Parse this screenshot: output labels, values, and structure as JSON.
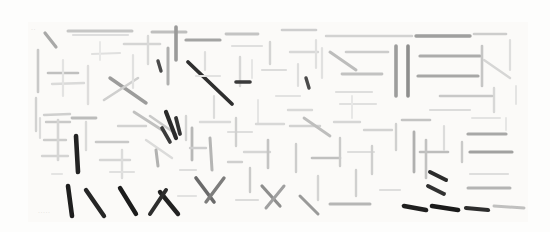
{
  "image": {
    "title": "Abstract stroke composition",
    "background_color": "#fdfdfc",
    "content_bounds": {
      "x": 30,
      "y": 24,
      "width": 495,
      "height": 196
    },
    "description": "Dense field of short straight line strokes in varying grays and blacks, arranged in loose grid-like clusters resembling deconstructed calligraphic characters"
  },
  "palette": {
    "paper": "#fdfdfc",
    "wash": "#fbfaf8",
    "lightest_stroke": "#ededec",
    "light_stroke": "#dcdcdb",
    "mid_stroke": "#b9b9b8",
    "dark_stroke": "#8a8a89",
    "darkest_stroke": "#2b2b2b"
  },
  "faint_marks": [
    {
      "text": "·····",
      "x": 38,
      "y": 210
    },
    {
      "text": "··",
      "x": 31,
      "y": 27
    }
  ],
  "strokes": [
    {
      "x1": 45,
      "y1": 33,
      "x2": 56,
      "y2": 47,
      "w": 3.2,
      "c": "#a9a9a8"
    },
    {
      "x1": 68,
      "y1": 31,
      "x2": 132,
      "y2": 31,
      "w": 3.0,
      "c": "#c6c6c5"
    },
    {
      "x1": 73,
      "y1": 35,
      "x2": 128,
      "y2": 35,
      "w": 2.2,
      "c": "#dedede"
    },
    {
      "x1": 38,
      "y1": 50,
      "x2": 38,
      "y2": 92,
      "w": 2.6,
      "c": "#c9c9c8"
    },
    {
      "x1": 36,
      "y1": 98,
      "x2": 36,
      "y2": 131,
      "w": 2.4,
      "c": "#d2d2d1"
    },
    {
      "x1": 48,
      "y1": 73,
      "x2": 78,
      "y2": 73,
      "w": 2.6,
      "c": "#c0c0bf"
    },
    {
      "x1": 52,
      "y1": 84,
      "x2": 84,
      "y2": 83,
      "w": 2.4,
      "c": "#dadad9"
    },
    {
      "x1": 44,
      "y1": 115,
      "x2": 70,
      "y2": 114,
      "w": 2.4,
      "c": "#cfcfce"
    },
    {
      "x1": 63,
      "y1": 60,
      "x2": 63,
      "y2": 96,
      "w": 2.2,
      "c": "#e3e3e2"
    },
    {
      "x1": 92,
      "y1": 54,
      "x2": 120,
      "y2": 53,
      "w": 2.2,
      "c": "#e0e0df"
    },
    {
      "x1": 88,
      "y1": 66,
      "x2": 88,
      "y2": 104,
      "w": 2.4,
      "c": "#dedddc"
    },
    {
      "x1": 100,
      "y1": 42,
      "x2": 100,
      "y2": 60,
      "w": 2.0,
      "c": "#e8e8e7"
    },
    {
      "x1": 110,
      "y1": 78,
      "x2": 146,
      "y2": 103,
      "w": 3.4,
      "c": "#9c9c9b"
    },
    {
      "x1": 104,
      "y1": 100,
      "x2": 138,
      "y2": 78,
      "w": 2.6,
      "c": "#cfcfce"
    },
    {
      "x1": 124,
      "y1": 44,
      "x2": 160,
      "y2": 44,
      "w": 2.6,
      "c": "#d5d5d4"
    },
    {
      "x1": 133,
      "y1": 55,
      "x2": 133,
      "y2": 88,
      "w": 2.2,
      "c": "#e1e1e0"
    },
    {
      "x1": 148,
      "y1": 36,
      "x2": 148,
      "y2": 64,
      "w": 2.4,
      "c": "#d9d9d8"
    },
    {
      "x1": 152,
      "y1": 32,
      "x2": 186,
      "y2": 32,
      "w": 3.0,
      "c": "#bfbfbe"
    },
    {
      "x1": 158,
      "y1": 61,
      "x2": 161,
      "y2": 71,
      "w": 3.4,
      "c": "#4a4a4a"
    },
    {
      "x1": 168,
      "y1": 48,
      "x2": 168,
      "y2": 84,
      "w": 3.0,
      "c": "#b0b0af"
    },
    {
      "x1": 176,
      "y1": 27,
      "x2": 176,
      "y2": 60,
      "w": 3.6,
      "c": "#9a9a99"
    },
    {
      "x1": 186,
      "y1": 40,
      "x2": 220,
      "y2": 40,
      "w": 3.2,
      "c": "#a4a4a3"
    },
    {
      "x1": 188,
      "y1": 62,
      "x2": 232,
      "y2": 104,
      "w": 3.8,
      "c": "#2f2f2f"
    },
    {
      "x1": 196,
      "y1": 76,
      "x2": 220,
      "y2": 76,
      "w": 2.2,
      "c": "#e2e2e1"
    },
    {
      "x1": 205,
      "y1": 52,
      "x2": 205,
      "y2": 70,
      "w": 2.2,
      "c": "#dededd"
    },
    {
      "x1": 214,
      "y1": 96,
      "x2": 214,
      "y2": 118,
      "w": 2.2,
      "c": "#dcdcdb"
    },
    {
      "x1": 226,
      "y1": 34,
      "x2": 258,
      "y2": 34,
      "w": 2.8,
      "c": "#c4c4c3"
    },
    {
      "x1": 232,
      "y1": 46,
      "x2": 262,
      "y2": 46,
      "w": 2.2,
      "c": "#dfdfde"
    },
    {
      "x1": 240,
      "y1": 57,
      "x2": 240,
      "y2": 86,
      "w": 2.4,
      "c": "#d7d7d6"
    },
    {
      "x1": 236,
      "y1": 82,
      "x2": 250,
      "y2": 82,
      "w": 3.6,
      "c": "#3a3a3a"
    },
    {
      "x1": 252,
      "y1": 60,
      "x2": 252,
      "y2": 78,
      "w": 2.0,
      "c": "#e6e6e5"
    },
    {
      "x1": 262,
      "y1": 70,
      "x2": 286,
      "y2": 70,
      "w": 2.2,
      "c": "#dcdcdb"
    },
    {
      "x1": 270,
      "y1": 42,
      "x2": 270,
      "y2": 64,
      "w": 2.4,
      "c": "#d4d4d3"
    },
    {
      "x1": 258,
      "y1": 100,
      "x2": 258,
      "y2": 124,
      "w": 2.0,
      "c": "#e5e5e4"
    },
    {
      "x1": 282,
      "y1": 30,
      "x2": 316,
      "y2": 30,
      "w": 2.6,
      "c": "#cecece"
    },
    {
      "x1": 290,
      "y1": 52,
      "x2": 318,
      "y2": 52,
      "w": 2.4,
      "c": "#d8d8d7"
    },
    {
      "x1": 298,
      "y1": 64,
      "x2": 298,
      "y2": 86,
      "w": 2.2,
      "c": "#dededd"
    },
    {
      "x1": 306,
      "y1": 78,
      "x2": 309,
      "y2": 88,
      "w": 3.4,
      "c": "#4b4b4b"
    },
    {
      "x1": 316,
      "y1": 40,
      "x2": 316,
      "y2": 68,
      "w": 2.2,
      "c": "#e0e0df"
    },
    {
      "x1": 276,
      "y1": 96,
      "x2": 300,
      "y2": 96,
      "w": 2.2,
      "c": "#e2e2e1"
    },
    {
      "x1": 288,
      "y1": 110,
      "x2": 312,
      "y2": 110,
      "w": 2.4,
      "c": "#d9d9d8"
    },
    {
      "x1": 326,
      "y1": 36,
      "x2": 412,
      "y2": 36,
      "w": 2.4,
      "c": "#d2d2d1"
    },
    {
      "x1": 330,
      "y1": 52,
      "x2": 356,
      "y2": 70,
      "w": 3.0,
      "c": "#bdbdbc"
    },
    {
      "x1": 346,
      "y1": 52,
      "x2": 388,
      "y2": 52,
      "w": 2.6,
      "c": "#cccccb"
    },
    {
      "x1": 342,
      "y1": 74,
      "x2": 382,
      "y2": 74,
      "w": 2.8,
      "c": "#c2c2c1"
    },
    {
      "x1": 336,
      "y1": 92,
      "x2": 372,
      "y2": 92,
      "w": 2.2,
      "c": "#dededd"
    },
    {
      "x1": 322,
      "y1": 48,
      "x2": 322,
      "y2": 78,
      "w": 2.2,
      "c": "#e1e1e0"
    },
    {
      "x1": 396,
      "y1": 46,
      "x2": 396,
      "y2": 96,
      "w": 3.6,
      "c": "#9d9d9c"
    },
    {
      "x1": 408,
      "y1": 46,
      "x2": 408,
      "y2": 96,
      "w": 3.6,
      "c": "#8e8e8d"
    },
    {
      "x1": 416,
      "y1": 36,
      "x2": 470,
      "y2": 36,
      "w": 3.4,
      "c": "#9f9f9e"
    },
    {
      "x1": 420,
      "y1": 56,
      "x2": 480,
      "y2": 56,
      "w": 3.2,
      "c": "#acacab"
    },
    {
      "x1": 418,
      "y1": 76,
      "x2": 478,
      "y2": 76,
      "w": 3.2,
      "c": "#a7a7a6"
    },
    {
      "x1": 474,
      "y1": 34,
      "x2": 506,
      "y2": 34,
      "w": 2.6,
      "c": "#cdcdcc"
    },
    {
      "x1": 482,
      "y1": 46,
      "x2": 482,
      "y2": 86,
      "w": 2.6,
      "c": "#c6c6c5"
    },
    {
      "x1": 484,
      "y1": 60,
      "x2": 510,
      "y2": 78,
      "w": 2.4,
      "c": "#d6d6d5"
    },
    {
      "x1": 494,
      "y1": 88,
      "x2": 494,
      "y2": 112,
      "w": 2.4,
      "c": "#d8d8d7"
    },
    {
      "x1": 440,
      "y1": 96,
      "x2": 492,
      "y2": 96,
      "w": 2.6,
      "c": "#c8c8c7"
    },
    {
      "x1": 430,
      "y1": 110,
      "x2": 470,
      "y2": 110,
      "w": 2.2,
      "c": "#dcdcdb"
    },
    {
      "x1": 340,
      "y1": 104,
      "x2": 376,
      "y2": 104,
      "w": 2.2,
      "c": "#e0e0df"
    },
    {
      "x1": 352,
      "y1": 96,
      "x2": 352,
      "y2": 118,
      "w": 2.0,
      "c": "#e7e7e6"
    },
    {
      "x1": 40,
      "y1": 118,
      "x2": 40,
      "y2": 138,
      "w": 2.2,
      "c": "#dcdcdb"
    },
    {
      "x1": 46,
      "y1": 122,
      "x2": 70,
      "y2": 122,
      "w": 2.4,
      "c": "#c9c9c8"
    },
    {
      "x1": 44,
      "y1": 140,
      "x2": 66,
      "y2": 140,
      "w": 2.4,
      "c": "#cdcdcc"
    },
    {
      "x1": 42,
      "y1": 156,
      "x2": 68,
      "y2": 156,
      "w": 2.4,
      "c": "#d4d4d3"
    },
    {
      "x1": 58,
      "y1": 120,
      "x2": 58,
      "y2": 160,
      "w": 2.6,
      "c": "#d6d6d5"
    },
    {
      "x1": 76,
      "y1": 136,
      "x2": 78,
      "y2": 172,
      "w": 4.6,
      "c": "#232323"
    },
    {
      "x1": 72,
      "y1": 118,
      "x2": 96,
      "y2": 118,
      "w": 2.8,
      "c": "#bcbcbb"
    },
    {
      "x1": 86,
      "y1": 122,
      "x2": 86,
      "y2": 150,
      "w": 2.4,
      "c": "#dadad9"
    },
    {
      "x1": 68,
      "y1": 186,
      "x2": 72,
      "y2": 216,
      "w": 4.6,
      "c": "#1e1e1e"
    },
    {
      "x1": 86,
      "y1": 190,
      "x2": 104,
      "y2": 216,
      "w": 4.4,
      "c": "#262626"
    },
    {
      "x1": 96,
      "y1": 142,
      "x2": 128,
      "y2": 142,
      "w": 2.6,
      "c": "#c8c8c7"
    },
    {
      "x1": 100,
      "y1": 160,
      "x2": 130,
      "y2": 160,
      "w": 2.4,
      "c": "#d6d6d5"
    },
    {
      "x1": 118,
      "y1": 126,
      "x2": 146,
      "y2": 126,
      "w": 2.4,
      "c": "#d2d2d1"
    },
    {
      "x1": 122,
      "y1": 150,
      "x2": 122,
      "y2": 178,
      "w": 2.4,
      "c": "#dcdcdb"
    },
    {
      "x1": 134,
      "y1": 112,
      "x2": 162,
      "y2": 130,
      "w": 2.8,
      "c": "#c0c0bf"
    },
    {
      "x1": 146,
      "y1": 140,
      "x2": 172,
      "y2": 158,
      "w": 2.4,
      "c": "#dbdbda"
    },
    {
      "x1": 150,
      "y1": 116,
      "x2": 176,
      "y2": 134,
      "w": 2.6,
      "c": "#cacac9"
    },
    {
      "x1": 156,
      "y1": 150,
      "x2": 158,
      "y2": 166,
      "w": 3.0,
      "c": "#b2b2b1"
    },
    {
      "x1": 166,
      "y1": 112,
      "x2": 176,
      "y2": 138,
      "w": 4.2,
      "c": "#2a2a2a"
    },
    {
      "x1": 176,
      "y1": 118,
      "x2": 180,
      "y2": 134,
      "w": 3.8,
      "c": "#333333"
    },
    {
      "x1": 162,
      "y1": 128,
      "x2": 170,
      "y2": 142,
      "w": 3.6,
      "c": "#3b3b3b"
    },
    {
      "x1": 120,
      "y1": 188,
      "x2": 136,
      "y2": 214,
      "w": 4.4,
      "c": "#1c1c1c"
    },
    {
      "x1": 160,
      "y1": 192,
      "x2": 178,
      "y2": 214,
      "w": 4.4,
      "c": "#222222"
    },
    {
      "x1": 166,
      "y1": 190,
      "x2": 150,
      "y2": 214,
      "w": 4.0,
      "c": "#2e2e2e"
    },
    {
      "x1": 186,
      "y1": 116,
      "x2": 186,
      "y2": 140,
      "w": 2.4,
      "c": "#d4d4d3"
    },
    {
      "x1": 192,
      "y1": 128,
      "x2": 192,
      "y2": 160,
      "w": 2.8,
      "c": "#b8b8b7"
    },
    {
      "x1": 190,
      "y1": 148,
      "x2": 206,
      "y2": 148,
      "w": 2.4,
      "c": "#cecece"
    },
    {
      "x1": 200,
      "y1": 122,
      "x2": 230,
      "y2": 122,
      "w": 2.4,
      "c": "#dadad9"
    },
    {
      "x1": 210,
      "y1": 138,
      "x2": 212,
      "y2": 170,
      "w": 3.0,
      "c": "#b5b5b4"
    },
    {
      "x1": 196,
      "y1": 178,
      "x2": 214,
      "y2": 202,
      "w": 3.6,
      "c": "#6a6a6a"
    },
    {
      "x1": 224,
      "y1": 178,
      "x2": 206,
      "y2": 202,
      "w": 3.4,
      "c": "#7d7d7c"
    },
    {
      "x1": 228,
      "y1": 132,
      "x2": 252,
      "y2": 132,
      "w": 2.2,
      "c": "#dededd"
    },
    {
      "x1": 236,
      "y1": 118,
      "x2": 236,
      "y2": 146,
      "w": 2.4,
      "c": "#d0d0cf"
    },
    {
      "x1": 244,
      "y1": 152,
      "x2": 270,
      "y2": 152,
      "w": 2.4,
      "c": "#d6d6d5"
    },
    {
      "x1": 250,
      "y1": 168,
      "x2": 250,
      "y2": 192,
      "w": 2.4,
      "c": "#cacac9"
    },
    {
      "x1": 256,
      "y1": 124,
      "x2": 284,
      "y2": 124,
      "w": 2.4,
      "c": "#d8d8d7"
    },
    {
      "x1": 268,
      "y1": 140,
      "x2": 268,
      "y2": 168,
      "w": 2.6,
      "c": "#c4c4c3"
    },
    {
      "x1": 262,
      "y1": 186,
      "x2": 280,
      "y2": 206,
      "w": 3.2,
      "c": "#8e8e8d"
    },
    {
      "x1": 284,
      "y1": 186,
      "x2": 266,
      "y2": 208,
      "w": 3.0,
      "c": "#a0a0a0"
    },
    {
      "x1": 290,
      "y1": 126,
      "x2": 320,
      "y2": 126,
      "w": 2.4,
      "c": "#d2d2d1"
    },
    {
      "x1": 296,
      "y1": 144,
      "x2": 296,
      "y2": 172,
      "w": 2.4,
      "c": "#cdcdcc"
    },
    {
      "x1": 304,
      "y1": 118,
      "x2": 330,
      "y2": 136,
      "w": 2.8,
      "c": "#bebebd"
    },
    {
      "x1": 312,
      "y1": 158,
      "x2": 340,
      "y2": 158,
      "w": 2.6,
      "c": "#c0c0bf"
    },
    {
      "x1": 318,
      "y1": 176,
      "x2": 318,
      "y2": 200,
      "w": 2.4,
      "c": "#d4d4d3"
    },
    {
      "x1": 300,
      "y1": 196,
      "x2": 318,
      "y2": 214,
      "w": 3.0,
      "c": "#9a9a99"
    },
    {
      "x1": 334,
      "y1": 122,
      "x2": 360,
      "y2": 122,
      "w": 2.4,
      "c": "#d6d6d5"
    },
    {
      "x1": 340,
      "y1": 138,
      "x2": 340,
      "y2": 166,
      "w": 2.4,
      "c": "#cbcbca"
    },
    {
      "x1": 348,
      "y1": 152,
      "x2": 374,
      "y2": 152,
      "w": 2.2,
      "c": "#dededd"
    },
    {
      "x1": 356,
      "y1": 170,
      "x2": 356,
      "y2": 196,
      "w": 2.4,
      "c": "#d0d0cf"
    },
    {
      "x1": 364,
      "y1": 130,
      "x2": 392,
      "y2": 130,
      "w": 2.4,
      "c": "#d3d3d2"
    },
    {
      "x1": 372,
      "y1": 146,
      "x2": 372,
      "y2": 174,
      "w": 2.4,
      "c": "#cfcfce"
    },
    {
      "x1": 330,
      "y1": 204,
      "x2": 370,
      "y2": 204,
      "w": 3.0,
      "c": "#b6b6b5"
    },
    {
      "x1": 396,
      "y1": 124,
      "x2": 396,
      "y2": 150,
      "w": 2.4,
      "c": "#d0d0cf"
    },
    {
      "x1": 402,
      "y1": 120,
      "x2": 430,
      "y2": 120,
      "w": 2.6,
      "c": "#c4c4c3"
    },
    {
      "x1": 414,
      "y1": 132,
      "x2": 414,
      "y2": 172,
      "w": 2.8,
      "c": "#b0b0af"
    },
    {
      "x1": 420,
      "y1": 152,
      "x2": 448,
      "y2": 152,
      "w": 2.6,
      "c": "#bdbdbc"
    },
    {
      "x1": 426,
      "y1": 140,
      "x2": 426,
      "y2": 178,
      "w": 2.6,
      "c": "#c2c2c1"
    },
    {
      "x1": 430,
      "y1": 172,
      "x2": 446,
      "y2": 180,
      "w": 4.0,
      "c": "#2b2b2b"
    },
    {
      "x1": 428,
      "y1": 186,
      "x2": 444,
      "y2": 194,
      "w": 3.8,
      "c": "#313131"
    },
    {
      "x1": 404,
      "y1": 206,
      "x2": 426,
      "y2": 210,
      "w": 4.6,
      "c": "#1f1f1f"
    },
    {
      "x1": 432,
      "y1": 206,
      "x2": 458,
      "y2": 210,
      "w": 4.6,
      "c": "#1a1a1a"
    },
    {
      "x1": 444,
      "y1": 126,
      "x2": 444,
      "y2": 150,
      "w": 2.2,
      "c": "#dcdcdb"
    },
    {
      "x1": 472,
      "y1": 118,
      "x2": 500,
      "y2": 118,
      "w": 2.0,
      "c": "#e3e3e2"
    },
    {
      "x1": 468,
      "y1": 134,
      "x2": 506,
      "y2": 134,
      "w": 3.2,
      "c": "#a8a8a7"
    },
    {
      "x1": 470,
      "y1": 152,
      "x2": 512,
      "y2": 152,
      "w": 3.2,
      "c": "#a1a1a0"
    },
    {
      "x1": 462,
      "y1": 142,
      "x2": 462,
      "y2": 162,
      "w": 2.4,
      "c": "#cacac9"
    },
    {
      "x1": 470,
      "y1": 174,
      "x2": 508,
      "y2": 174,
      "w": 2.2,
      "c": "#dededd"
    },
    {
      "x1": 468,
      "y1": 188,
      "x2": 510,
      "y2": 188,
      "w": 3.0,
      "c": "#b4b4b3"
    },
    {
      "x1": 466,
      "y1": 208,
      "x2": 488,
      "y2": 210,
      "w": 4.2,
      "c": "#2d2d2d"
    },
    {
      "x1": 494,
      "y1": 206,
      "x2": 524,
      "y2": 208,
      "w": 3.0,
      "c": "#c0c0bf"
    },
    {
      "x1": 506,
      "y1": 118,
      "x2": 506,
      "y2": 130,
      "w": 2.0,
      "c": "#e6e6e5"
    },
    {
      "x1": 510,
      "y1": 40,
      "x2": 510,
      "y2": 70,
      "w": 2.2,
      "c": "#dededd"
    },
    {
      "x1": 516,
      "y1": 86,
      "x2": 516,
      "y2": 104,
      "w": 2.0,
      "c": "#e4e4e3"
    },
    {
      "x1": 180,
      "y1": 170,
      "x2": 196,
      "y2": 170,
      "w": 2.2,
      "c": "#dededd"
    },
    {
      "x1": 110,
      "y1": 172,
      "x2": 134,
      "y2": 172,
      "w": 2.2,
      "c": "#e0e0df"
    },
    {
      "x1": 228,
      "y1": 162,
      "x2": 242,
      "y2": 162,
      "w": 2.4,
      "c": "#cfcfce"
    },
    {
      "x1": 178,
      "y1": 196,
      "x2": 196,
      "y2": 196,
      "w": 2.2,
      "c": "#e2e2e1"
    },
    {
      "x1": 236,
      "y1": 200,
      "x2": 258,
      "y2": 200,
      "w": 2.2,
      "c": "#dcdcdb"
    },
    {
      "x1": 380,
      "y1": 190,
      "x2": 400,
      "y2": 190,
      "w": 2.2,
      "c": "#dededd"
    },
    {
      "x1": 52,
      "y1": 174,
      "x2": 62,
      "y2": 174,
      "w": 2.2,
      "c": "#e4e4e3"
    }
  ]
}
